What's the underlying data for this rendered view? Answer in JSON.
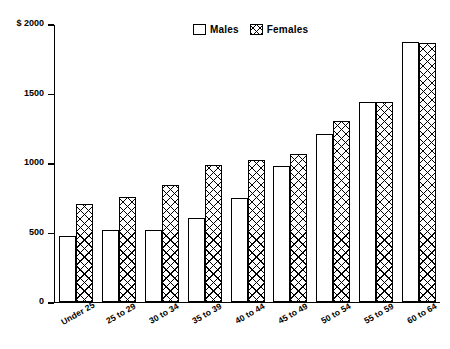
{
  "chart_data": {
    "type": "bar",
    "title": "",
    "xlabel": "",
    "ylabel": "",
    "currency_prefix": "$",
    "ylim": [
      0,
      2000
    ],
    "ytick_labels": [
      "$ 2000",
      "1500",
      "1000",
      "500",
      "0"
    ],
    "ytick_values": [
      2000,
      1500,
      1000,
      500,
      0
    ],
    "grid": false,
    "legend_position": "top-center",
    "categories": [
      "Under 25",
      "25 to 29",
      "30 to 34",
      "35 to 39",
      "40 to 44",
      "45 to 49",
      "50 to 54",
      "55 to 59",
      "60 to 64"
    ],
    "series": [
      {
        "name": "Males",
        "fill": "white",
        "values": [
          470,
          515,
          515,
          605,
          745,
          975,
          1210,
          1440,
          1865
        ]
      },
      {
        "name": "Females",
        "fill": "crosshatch",
        "values": [
          700,
          750,
          840,
          980,
          1020,
          1060,
          1300,
          1440,
          1860
        ]
      }
    ]
  },
  "legend": {
    "items": [
      {
        "label": "Males",
        "swatch": "empty-square-swatch"
      },
      {
        "label": "Females",
        "swatch": "crosshatch-square-swatch"
      }
    ]
  },
  "colors": {
    "ink": "#000000",
    "background": "#ffffff"
  }
}
